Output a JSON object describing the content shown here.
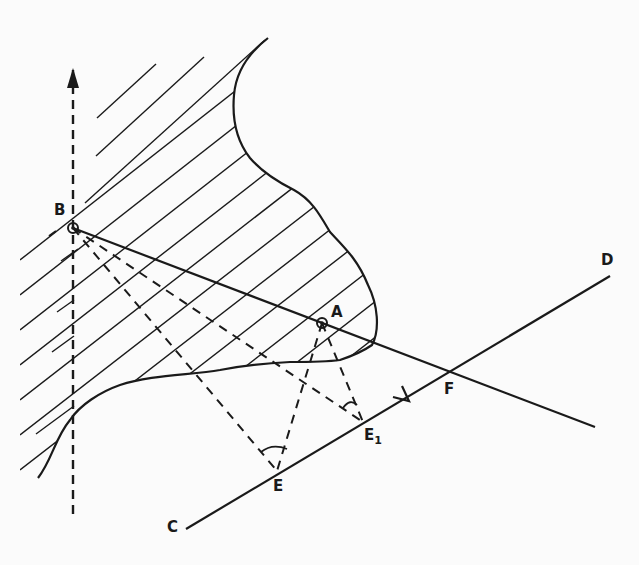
{
  "diagram": {
    "colors": {
      "ink": "#1a1a1a",
      "background": "#fbfbfb"
    },
    "labels": {
      "B": "B",
      "A": "A",
      "C": "C",
      "D": "D",
      "E": "E",
      "E1_main": "E",
      "E1_sub": "1",
      "F": "F"
    },
    "points": {
      "B": [
        73,
        228
      ],
      "A": [
        322,
        323
      ],
      "C": [
        186,
        529
      ],
      "D": [
        610,
        276
      ],
      "E": [
        277,
        471
      ],
      "E1": [
        363,
        422
      ],
      "F": [
        450,
        372
      ]
    },
    "lines": {
      "solid": [
        "C-D (directed, arrow toward D)",
        "B-A extended past F"
      ],
      "dashed": [
        "vertical axis through B (arrow up)",
        "B-E",
        "A-E",
        "B-E1",
        "A-E1"
      ]
    },
    "angle_marks": [
      "angle BEA at E",
      "angle BE1A at E1"
    ],
    "region": "hatched region bounded by irregular curve"
  }
}
